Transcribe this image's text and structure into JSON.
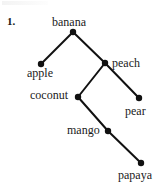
{
  "figure": {
    "item_number": "1.",
    "background_color": "#ffffff",
    "ink_color": "#111111",
    "node_radius": 3.2,
    "edge_width": 2.0,
    "width": 162,
    "height": 183
  },
  "chart_data": {
    "type": "diagram",
    "diagram_kind": "binary-tree",
    "title": "",
    "nodes": [
      {
        "id": "banana",
        "label": "banana",
        "x": 73,
        "y": 32,
        "label_x": 52,
        "label_y": 16,
        "label_align": "left"
      },
      {
        "id": "apple",
        "label": "apple",
        "x": 41,
        "y": 64,
        "label_x": 27,
        "label_y": 67,
        "label_align": "left"
      },
      {
        "id": "peach",
        "label": "peach",
        "x": 105,
        "y": 63,
        "label_x": 112,
        "label_y": 57,
        "label_align": "left"
      },
      {
        "id": "coconut",
        "label": "coconut",
        "x": 78,
        "y": 97,
        "label_x": 30,
        "label_y": 89,
        "label_align": "left"
      },
      {
        "id": "pear",
        "label": "pear",
        "x": 139,
        "y": 98,
        "label_x": 125,
        "label_y": 105,
        "label_align": "left"
      },
      {
        "id": "mango",
        "label": "mango",
        "x": 108,
        "y": 131,
        "label_x": 67,
        "label_y": 124,
        "label_align": "left"
      },
      {
        "id": "papaya",
        "label": "papaya",
        "x": 141,
        "y": 163,
        "label_x": 118,
        "label_y": 169,
        "label_align": "left"
      }
    ],
    "edges": [
      {
        "from": "banana",
        "to": "apple"
      },
      {
        "from": "banana",
        "to": "peach"
      },
      {
        "from": "peach",
        "to": "coconut"
      },
      {
        "from": "peach",
        "to": "pear"
      },
      {
        "from": "coconut",
        "to": "mango"
      },
      {
        "from": "mango",
        "to": "papaya"
      }
    ],
    "labels": {
      "banana": "banana",
      "apple": "apple",
      "peach": "peach",
      "coconut": "coconut",
      "pear": "pear",
      "mango": "mango",
      "papaya": "papaya"
    }
  }
}
